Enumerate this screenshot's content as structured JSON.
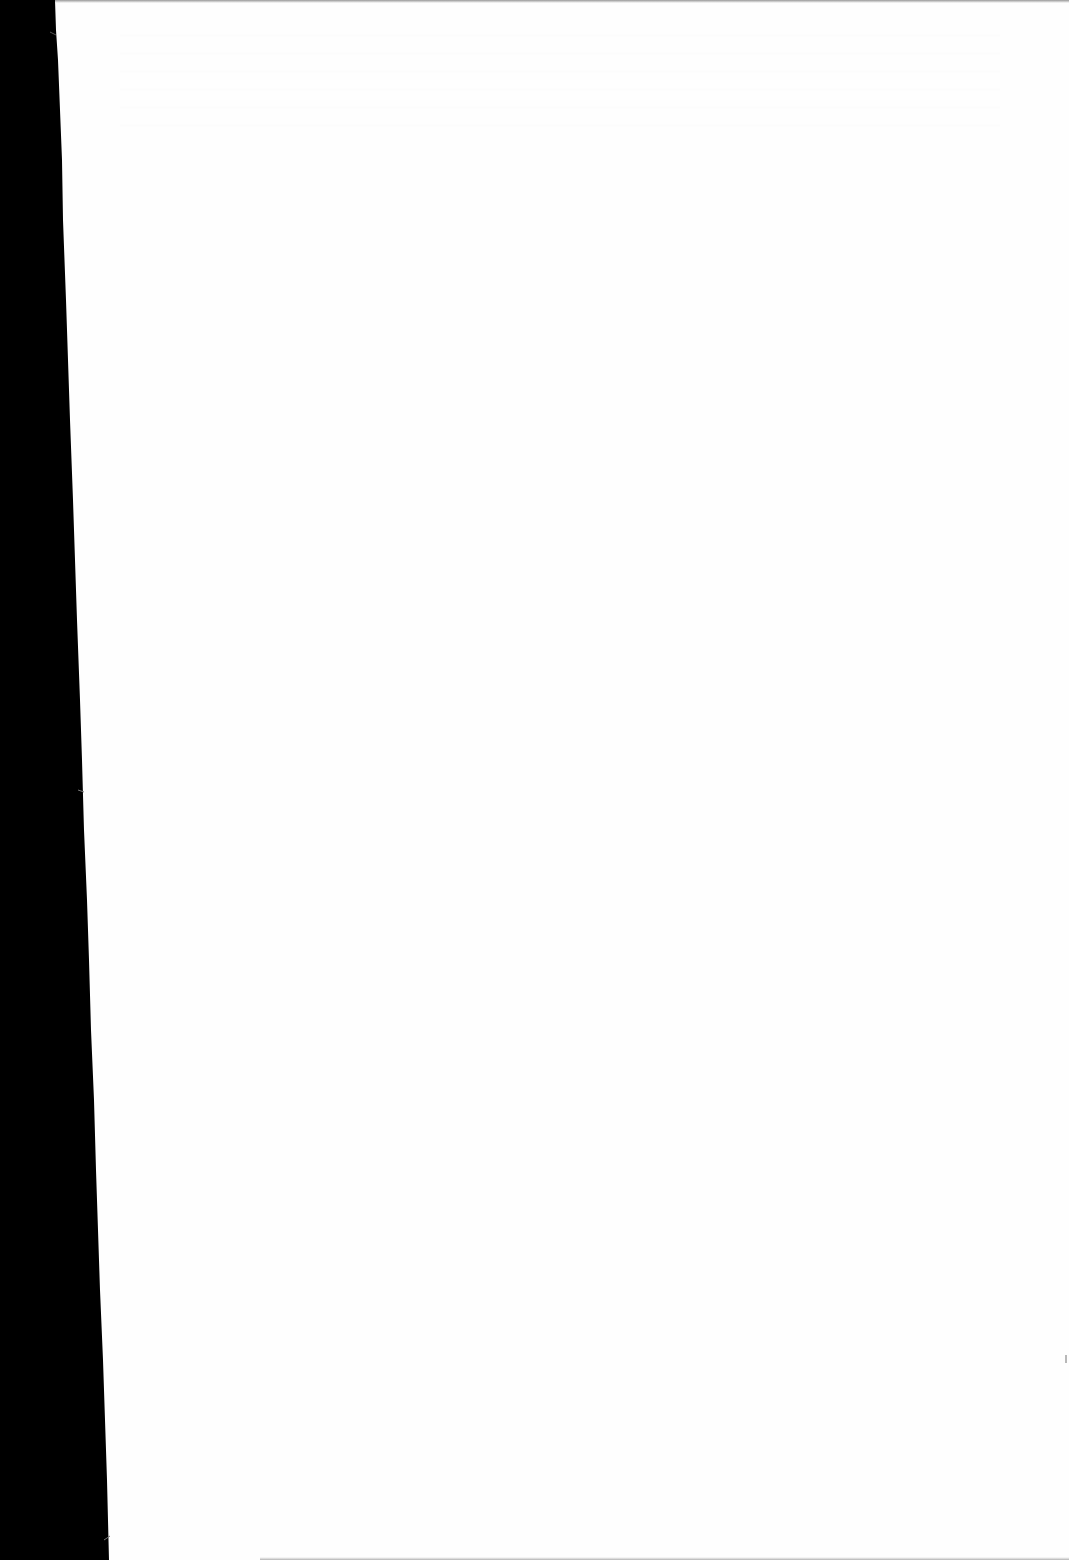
{
  "document": {
    "page_color": "#fefefe",
    "scanner_bed_color": "#000000",
    "content": {
      "text_blocks": [],
      "legible_text": false
    }
  }
}
